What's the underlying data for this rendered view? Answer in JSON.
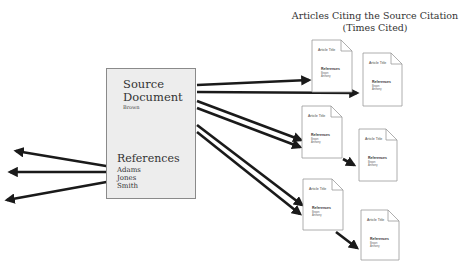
{
  "title": {
    "line1": "Articles Citing the Source Citation",
    "line2": "(Times Cited)"
  },
  "source": {
    "title_line1": "Source",
    "title_line2": "Document",
    "author": "Brown",
    "references_label": "References",
    "references": [
      "Adams",
      "Jones",
      "Smith"
    ]
  },
  "citing_articles": [
    {
      "title": "Article Title",
      "references_label": "References",
      "ref1": "Brown",
      "ref2": "Anthony"
    },
    {
      "title": "Article Title",
      "references_label": "References",
      "ref1": "Brown",
      "ref2": "Anthony"
    },
    {
      "title": "Article Title",
      "references_label": "References",
      "ref1": "Brown",
      "ref2": "Anthony"
    },
    {
      "title": "Article Title",
      "references_label": "References",
      "ref1": "Brown",
      "ref2": "Anthony"
    },
    {
      "title": "Article Title",
      "references_label": "References",
      "ref1": "Brown",
      "ref2": "Anthony"
    },
    {
      "title": "Article Title",
      "references_label": "References",
      "ref1": "Brown",
      "ref2": "Anthony"
    }
  ],
  "colors": {
    "arrow": "#1a1a1a",
    "source_fill": "#ededed",
    "doc_stroke": "#999999"
  }
}
